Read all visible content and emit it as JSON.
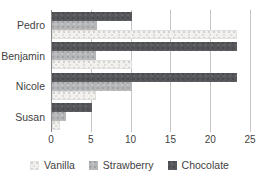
{
  "chart_data": {
    "type": "bar",
    "orientation": "horizontal",
    "title": "",
    "subtitle": "",
    "xlabel": "",
    "ylabel": "",
    "categories": [
      "Pedro",
      "Benjamin",
      "Nicole",
      "Susan"
    ],
    "series": [
      {
        "name": "Vanilla",
        "color": "#f2f1ef",
        "values": [
          23.2,
          10.0,
          5.5,
          1.0
        ]
      },
      {
        "name": "Strawberry",
        "color": "#b4b6b8",
        "values": [
          5.6,
          5.5,
          10.0,
          1.8
        ]
      },
      {
        "name": "Chocolate",
        "color": "#56575b",
        "values": [
          10.0,
          23.3,
          23.3,
          5.0
        ]
      }
    ],
    "xlim": [
      0,
      25
    ],
    "xticks": [
      0,
      5,
      10,
      15,
      20,
      25
    ],
    "xtick_labels": [
      "0",
      "5",
      "10",
      "15",
      "20",
      "25"
    ],
    "grid": true,
    "grid_axis": "x",
    "grid_style": "dashed",
    "legend": {
      "position": "bottom",
      "entries": [
        {
          "label": "Vanilla",
          "color": "#f2f1ef"
        },
        {
          "label": "Strawberry",
          "color": "#b4b6b8"
        },
        {
          "label": "Chocolate",
          "color": "#56575b"
        }
      ]
    }
  },
  "colors": {
    "background": "#ffffff",
    "text": "#3f3f3f",
    "gridline": "#c2c2c2",
    "axis": "#8a8a8a",
    "vanilla": "#f2f1ef",
    "strawberry": "#b4b6b8",
    "chocolate": "#56575b"
  }
}
